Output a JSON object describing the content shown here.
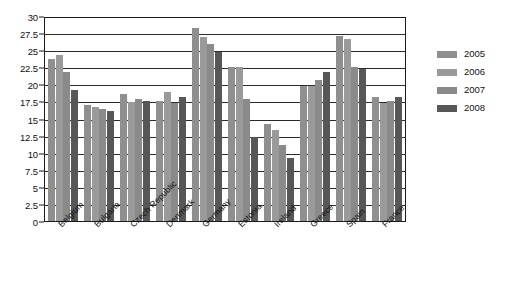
{
  "chart_data": {
    "type": "bar",
    "title": "",
    "subtitle": "",
    "xlabel": "",
    "ylabel": "",
    "ylim": [
      0,
      30
    ],
    "ytick_step": 2.5,
    "yticks": [
      "30",
      "27.5",
      "25",
      "22.5",
      "20",
      "17.5",
      "15",
      "12.5",
      "10",
      "7.5",
      "5",
      "2.5",
      "0"
    ],
    "grid": true,
    "legend_position": "right",
    "categories": [
      "Belgium",
      "Bulgaria",
      "Czech Republic",
      "Denmark",
      "Germany",
      "Estonia",
      "Ireland",
      "Greece",
      "Spain",
      "France"
    ],
    "series": [
      {
        "name": "2005",
        "color": "#8f8f8f",
        "values": [
          24.0,
          17.1,
          18.7,
          17.7,
          28.5,
          22.7,
          14.4,
          20.0,
          27.3,
          18.4
        ]
      },
      {
        "name": "2006",
        "color": "#9a9a9a",
        "values": [
          24.5,
          16.8,
          17.6,
          19.0,
          27.2,
          22.7,
          13.5,
          20.0,
          26.9,
          17.5
        ]
      },
      {
        "name": "2007",
        "color": "#8a8a8a",
        "values": [
          22.0,
          16.5,
          18.0,
          17.5,
          26.2,
          18.0,
          11.3,
          20.8,
          22.7,
          17.7
        ]
      },
      {
        "name": "2008",
        "color": "#575757",
        "values": [
          19.4,
          16.2,
          17.8,
          18.4,
          25.0,
          12.4,
          9.3,
          22.0,
          22.5,
          18.4
        ]
      }
    ]
  },
  "legend": {
    "items": [
      {
        "label": "2005",
        "color": "#8f8f8f"
      },
      {
        "label": "2006",
        "color": "#9a9a9a"
      },
      {
        "label": "2007",
        "color": "#8a8a8a"
      },
      {
        "label": "2008",
        "color": "#575757"
      }
    ]
  },
  "colors": {
    "axis": "#1a1a1a",
    "grid": "#2b2b2b",
    "text": "#111111",
    "background": "#ffffff"
  }
}
